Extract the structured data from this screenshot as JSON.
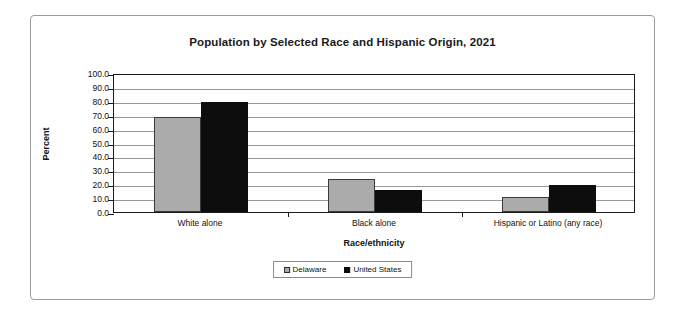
{
  "chart_data": {
    "type": "bar",
    "title": "Population by Selected Race and Hispanic Origin, 2021",
    "xlabel": "Race/ethnicity",
    "ylabel": "Percent",
    "categories": [
      "White alone",
      "Black alone",
      "Hispanic or Latino (any race)"
    ],
    "series": [
      {
        "name": "Delaware",
        "color": "#ababab",
        "values": [
          68.0,
          23.8,
          10.5
        ]
      },
      {
        "name": "United States",
        "color": "#0d0d0d",
        "values": [
          79.0,
          15.9,
          19.5
        ]
      }
    ],
    "ylim": [
      0.0,
      100.0
    ],
    "ytick_step": 10.0,
    "yticks": [
      "100.0",
      "90.0",
      "80.0",
      "70.0",
      "60.0",
      "50.0",
      "40.0",
      "30.0",
      "20.0",
      "10.0",
      "0.0"
    ],
    "grid": true,
    "legend_position": "bottom-center"
  }
}
